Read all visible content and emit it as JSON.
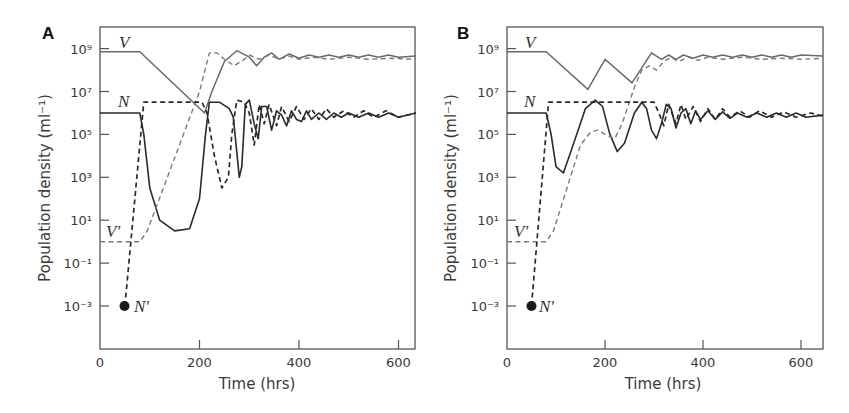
{
  "figure": {
    "panels": [
      {
        "label": "A",
        "xlabel": "Time (hrs)",
        "ylabel": "Population density (ml⁻¹)"
      },
      {
        "label": "B",
        "xlabel": "Time (hrs)",
        "ylabel": "Population density (ml⁻¹)"
      }
    ],
    "x_ticks": [
      "0",
      "200",
      "400",
      "600"
    ],
    "y_ticks": [
      "10⁹",
      "10⁷",
      "10⁵",
      "10³",
      "10¹",
      "10⁻¹",
      "10⁻³"
    ],
    "curve_labels": {
      "V": "V",
      "N": "N",
      "Vp": "V′",
      "Np": "N′"
    },
    "colors": {
      "solid_dark": "#2a2a2a",
      "solid_gray": "#6a6a6a",
      "dashed_dark": "#2a2a2a",
      "dashed_gray": "#7a7a7a"
    }
  },
  "chart_data": [
    {
      "type": "line",
      "title": "A",
      "xlabel": "Time (hrs)",
      "ylabel": "Population density (ml^-1)",
      "xlim": [
        0,
        635
      ],
      "ylim_log10": [
        -5,
        10
      ],
      "yscale": "log",
      "x_ticks": [
        0,
        200,
        400,
        600
      ],
      "y_ticks_log10": [
        9,
        7,
        5,
        3,
        1,
        -1,
        -3
      ],
      "series": [
        {
          "name": "V",
          "style": "solid gray",
          "points_log10": [
            [
              0,
              8.85
            ],
            [
              80,
              8.85
            ],
            [
              210,
              6.0
            ],
            [
              225,
              7.0
            ],
            [
              250,
              8.4
            ],
            [
              275,
              8.9
            ],
            [
              300,
              8.6
            ],
            [
              315,
              8.2
            ],
            [
              330,
              8.6
            ],
            [
              345,
              8.8
            ],
            [
              360,
              8.5
            ],
            [
              380,
              8.75
            ],
            [
              400,
              8.55
            ],
            [
              420,
              8.7
            ],
            [
              440,
              8.6
            ],
            [
              460,
              8.7
            ],
            [
              480,
              8.6
            ],
            [
              500,
              8.7
            ],
            [
              520,
              8.6
            ],
            [
              540,
              8.7
            ],
            [
              560,
              8.6
            ],
            [
              580,
              8.7
            ],
            [
              600,
              8.6
            ],
            [
              635,
              8.65
            ]
          ]
        },
        {
          "name": "N",
          "style": "solid dark",
          "points_log10": [
            [
              0,
              6.0
            ],
            [
              80,
              6.0
            ],
            [
              88,
              5.0
            ],
            [
              100,
              2.5
            ],
            [
              120,
              1.0
            ],
            [
              150,
              0.5
            ],
            [
              180,
              0.6
            ],
            [
              200,
              2.0
            ],
            [
              212,
              5.0
            ],
            [
              220,
              6.5
            ],
            [
              240,
              6.5
            ],
            [
              260,
              6.2
            ],
            [
              268,
              5.8
            ],
            [
              280,
              3.0
            ],
            [
              285,
              3.5
            ],
            [
              292,
              6.4
            ],
            [
              300,
              6.6
            ],
            [
              310,
              5.5
            ],
            [
              318,
              4.8
            ],
            [
              325,
              6.3
            ],
            [
              335,
              6.3
            ],
            [
              345,
              5.2
            ],
            [
              355,
              6.1
            ],
            [
              365,
              5.9
            ],
            [
              375,
              5.4
            ],
            [
              385,
              6.1
            ],
            [
              395,
              5.7
            ],
            [
              405,
              5.6
            ],
            [
              415,
              6.1
            ],
            [
              425,
              5.7
            ],
            [
              440,
              6.0
            ],
            [
              455,
              5.7
            ],
            [
              470,
              6.0
            ],
            [
              485,
              5.8
            ],
            [
              500,
              6.0
            ],
            [
              520,
              5.8
            ],
            [
              540,
              6.0
            ],
            [
              560,
              5.8
            ],
            [
              580,
              6.0
            ],
            [
              600,
              5.8
            ],
            [
              635,
              6.0
            ]
          ]
        },
        {
          "name": "V'",
          "style": "dashed gray",
          "points_log10": [
            [
              0,
              0.0
            ],
            [
              80,
              0.0
            ],
            [
              95,
              0.5
            ],
            [
              200,
              7.0
            ],
            [
              220,
              8.8
            ],
            [
              235,
              8.8
            ],
            [
              250,
              8.5
            ],
            [
              270,
              8.2
            ],
            [
              290,
              8.5
            ],
            [
              300,
              8.7
            ],
            [
              320,
              8.5
            ],
            [
              340,
              8.7
            ],
            [
              360,
              8.5
            ],
            [
              380,
              8.65
            ],
            [
              400,
              8.5
            ],
            [
              430,
              8.6
            ],
            [
              460,
              8.5
            ],
            [
              500,
              8.6
            ],
            [
              540,
              8.5
            ],
            [
              580,
              8.55
            ],
            [
              635,
              8.5
            ]
          ]
        },
        {
          "name": "N'",
          "style": "dashed dark",
          "points_log10": [
            [
              50,
              -3.0
            ],
            [
              88,
              6.5
            ],
            [
              180,
              6.5
            ],
            [
              205,
              6.5
            ],
            [
              215,
              6.0
            ],
            [
              230,
              4.0
            ],
            [
              245,
              2.5
            ],
            [
              258,
              3.0
            ],
            [
              265,
              5.0
            ],
            [
              275,
              6.6
            ],
            [
              290,
              6.5
            ],
            [
              300,
              6.0
            ],
            [
              310,
              4.5
            ],
            [
              320,
              6.4
            ],
            [
              330,
              5.5
            ],
            [
              340,
              6.4
            ],
            [
              355,
              5.4
            ],
            [
              365,
              6.3
            ],
            [
              380,
              5.6
            ],
            [
              395,
              6.3
            ],
            [
              410,
              5.7
            ],
            [
              425,
              6.2
            ],
            [
              440,
              5.7
            ],
            [
              455,
              6.2
            ],
            [
              470,
              5.8
            ],
            [
              490,
              6.1
            ],
            [
              510,
              5.8
            ],
            [
              530,
              6.1
            ],
            [
              550,
              5.8
            ],
            [
              575,
              6.1
            ],
            [
              600,
              5.8
            ],
            [
              635,
              6.0
            ]
          ]
        }
      ]
    },
    {
      "type": "line",
      "title": "B",
      "xlabel": "Time (hrs)",
      "ylabel": "Population density (ml^-1)",
      "xlim": [
        0,
        645
      ],
      "ylim_log10": [
        -5,
        10
      ],
      "yscale": "log",
      "x_ticks": [
        0,
        200,
        400,
        600
      ],
      "y_ticks_log10": [
        9,
        7,
        5,
        3,
        1,
        -1,
        -3
      ],
      "series": [
        {
          "name": "V",
          "style": "solid gray",
          "points_log10": [
            [
              0,
              8.85
            ],
            [
              80,
              8.85
            ],
            [
              165,
              7.1
            ],
            [
              200,
              8.5
            ],
            [
              255,
              7.4
            ],
            [
              275,
              8.1
            ],
            [
              295,
              8.8
            ],
            [
              315,
              8.5
            ],
            [
              330,
              8.7
            ],
            [
              345,
              8.5
            ],
            [
              360,
              8.7
            ],
            [
              380,
              8.55
            ],
            [
              400,
              8.7
            ],
            [
              420,
              8.6
            ],
            [
              440,
              8.7
            ],
            [
              460,
              8.6
            ],
            [
              480,
              8.7
            ],
            [
              500,
              8.6
            ],
            [
              520,
              8.7
            ],
            [
              540,
              8.6
            ],
            [
              560,
              8.7
            ],
            [
              580,
              8.6
            ],
            [
              600,
              8.7
            ],
            [
              645,
              8.65
            ]
          ]
        },
        {
          "name": "N",
          "style": "solid dark",
          "points_log10": [
            [
              0,
              6.0
            ],
            [
              80,
              6.0
            ],
            [
              90,
              5.0
            ],
            [
              100,
              3.5
            ],
            [
              115,
              3.2
            ],
            [
              135,
              4.5
            ],
            [
              160,
              6.2
            ],
            [
              180,
              6.6
            ],
            [
              195,
              6.3
            ],
            [
              210,
              5.0
            ],
            [
              225,
              4.2
            ],
            [
              240,
              4.6
            ],
            [
              260,
              6.0
            ],
            [
              275,
              6.5
            ],
            [
              285,
              6.2
            ],
            [
              295,
              5.2
            ],
            [
              305,
              4.8
            ],
            [
              315,
              5.5
            ],
            [
              325,
              6.4
            ],
            [
              335,
              6.2
            ],
            [
              345,
              5.3
            ],
            [
              355,
              6.0
            ],
            [
              365,
              6.2
            ],
            [
              375,
              5.5
            ],
            [
              385,
              6.1
            ],
            [
              395,
              5.7
            ],
            [
              410,
              6.1
            ],
            [
              425,
              5.7
            ],
            [
              440,
              6.05
            ],
            [
              455,
              5.75
            ],
            [
              470,
              6.0
            ],
            [
              490,
              5.8
            ],
            [
              510,
              6.0
            ],
            [
              530,
              5.8
            ],
            [
              550,
              6.0
            ],
            [
              570,
              5.8
            ],
            [
              590,
              6.0
            ],
            [
              610,
              5.8
            ],
            [
              645,
              5.9
            ]
          ]
        },
        {
          "name": "V'",
          "style": "dashed gray",
          "points_log10": [
            [
              0,
              0.0
            ],
            [
              80,
              0.0
            ],
            [
              95,
              0.5
            ],
            [
              150,
              4.5
            ],
            [
              170,
              5.1
            ],
            [
              185,
              5.2
            ],
            [
              200,
              5.0
            ],
            [
              220,
              4.8
            ],
            [
              235,
              5.5
            ],
            [
              260,
              7.2
            ],
            [
              275,
              8.0
            ],
            [
              290,
              8.2
            ],
            [
              305,
              8.0
            ],
            [
              320,
              8.4
            ],
            [
              335,
              8.6
            ],
            [
              350,
              8.4
            ],
            [
              370,
              8.6
            ],
            [
              390,
              8.45
            ],
            [
              410,
              8.6
            ],
            [
              440,
              8.5
            ],
            [
              480,
              8.6
            ],
            [
              520,
              8.5
            ],
            [
              560,
              8.55
            ],
            [
              600,
              8.5
            ],
            [
              645,
              8.55
            ]
          ]
        },
        {
          "name": "N'",
          "style": "dashed dark",
          "points_log10": [
            [
              50,
              -3.0
            ],
            [
              85,
              6.5
            ],
            [
              200,
              6.5
            ],
            [
              260,
              6.5
            ],
            [
              300,
              6.5
            ],
            [
              310,
              6.0
            ],
            [
              320,
              5.4
            ],
            [
              330,
              6.4
            ],
            [
              345,
              5.5
            ],
            [
              355,
              6.4
            ],
            [
              365,
              5.7
            ],
            [
              380,
              6.3
            ],
            [
              395,
              5.6
            ],
            [
              410,
              6.2
            ],
            [
              425,
              5.7
            ],
            [
              440,
              6.2
            ],
            [
              455,
              5.8
            ],
            [
              475,
              6.1
            ],
            [
              495,
              5.8
            ],
            [
              515,
              6.1
            ],
            [
              540,
              5.8
            ],
            [
              565,
              6.05
            ],
            [
              590,
              5.8
            ],
            [
              620,
              6.0
            ],
            [
              645,
              5.85
            ]
          ]
        }
      ]
    }
  ]
}
